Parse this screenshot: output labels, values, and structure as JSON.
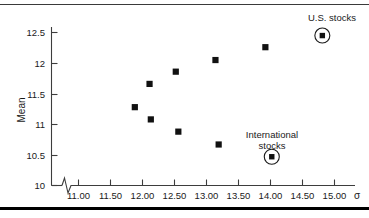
{
  "chart_data": {
    "type": "scatter",
    "title": "",
    "xlabel": "σ",
    "ylabel": "Mean",
    "xlim": [
      10.63,
      15.35
    ],
    "ylim": [
      10.0,
      12.72
    ],
    "grid": false,
    "legend": "none",
    "axis_break_x": true,
    "xticks": [
      "11.00",
      "11.50",
      "12.00",
      "12.50",
      "13.00",
      "13.50",
      "14.00",
      "14.50",
      "15.00"
    ],
    "xtick_values": [
      11.0,
      11.5,
      12.0,
      12.5,
      13.0,
      13.5,
      14.0,
      14.5,
      15.0
    ],
    "yticks": [
      "10",
      "10.5",
      "11",
      "11.5",
      "12",
      "12.5"
    ],
    "ytick_values": [
      10.0,
      10.5,
      11.0,
      11.5,
      12.0,
      12.5
    ],
    "series": [
      {
        "name": "portfolios",
        "marker": "filled-square",
        "points": [
          {
            "x": 11.88,
            "y": 11.28
          },
          {
            "x": 12.11,
            "y": 11.66
          },
          {
            "x": 12.13,
            "y": 11.08
          },
          {
            "x": 12.52,
            "y": 11.86
          },
          {
            "x": 12.56,
            "y": 10.88
          },
          {
            "x": 13.14,
            "y": 12.05
          },
          {
            "x": 13.19,
            "y": 10.67
          },
          {
            "x": 13.92,
            "y": 12.26
          }
        ]
      },
      {
        "name": "highlighted",
        "marker": "circled-square",
        "points": [
          {
            "x": 14.81,
            "y": 12.45,
            "label": "U.S. stocks"
          },
          {
            "x": 14.02,
            "y": 10.47,
            "label": "International stocks"
          }
        ]
      }
    ],
    "annotations": [
      {
        "name": "us-stocks",
        "lines": [
          "U.S. stocks"
        ],
        "x": 14.81,
        "y": 12.45
      },
      {
        "name": "international-stocks",
        "lines": [
          "International",
          "stocks"
        ],
        "x": 14.02,
        "y": 10.47
      }
    ]
  },
  "axis": {
    "x_symbol": "σ",
    "y_name": "Mean"
  },
  "labels": {
    "us_stocks": "U.S. stocks",
    "international_line1": "International",
    "international_line2": "stocks"
  },
  "colors": {
    "marker": "#111111",
    "axis": "#3d3d3d",
    "text": "#1a1a1a",
    "rule": "#000000",
    "background": "#ffffff"
  }
}
